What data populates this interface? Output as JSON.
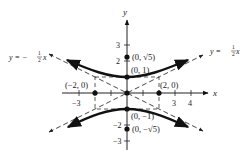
{
  "diagram": {
    "axes": {
      "x_label": "x",
      "y_label": "y",
      "x_ticks": [
        {
          "value": -3,
          "label": "−3"
        },
        {
          "value": 3,
          "label": "3"
        },
        {
          "value": 4,
          "label": "4"
        }
      ],
      "y_ticks": [
        {
          "value": 3,
          "label": "3"
        },
        {
          "value": 2,
          "label": "2"
        },
        {
          "value": -2,
          "label": "−2"
        },
        {
          "value": -3,
          "label": "−3"
        }
      ]
    },
    "points": {
      "top_focus": "(0, √5)",
      "top_vertex": "(0, 1)",
      "left_point": "(−2, 0)",
      "right_point": "(2, 0)",
      "bottom_vertex": "(0, −1)",
      "bottom_focus": "(0, −√5)"
    },
    "asymptotes": {
      "left": {
        "prefix": "y = −",
        "num": "1",
        "den": "2",
        "var": "x"
      },
      "right": {
        "prefix": "y = ",
        "num": "1",
        "den": "2",
        "var": "x"
      }
    },
    "colors": {
      "curve": "#111111",
      "dashed": "#333333",
      "axis": "#222222"
    }
  }
}
